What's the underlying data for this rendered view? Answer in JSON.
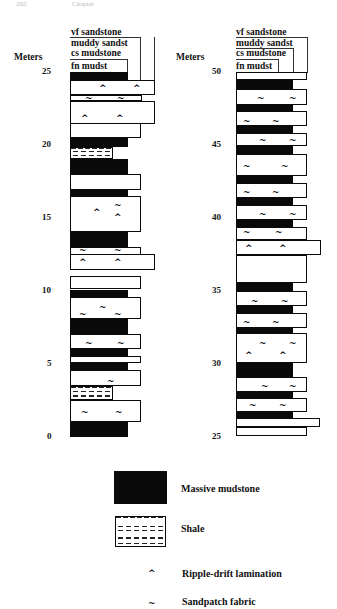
{
  "header": {
    "page_number": "202",
    "running_title": "Chapter"
  },
  "axis": {
    "units_label": "Meters"
  },
  "grain_size_labels": [
    "vf sandstone",
    "muddy sandst",
    "cs mudstone",
    "fn mudst"
  ],
  "columns": [
    {
      "id": "lower",
      "ticks": [
        {
          "label": "25",
          "y": 71
        },
        {
          "label": "20",
          "y": 144
        },
        {
          "label": "15",
          "y": 217
        },
        {
          "label": "10",
          "y": 290
        },
        {
          "label": "5",
          "y": 363
        },
        {
          "label": "0",
          "y": 436
        }
      ],
      "layers": [
        {
          "type": "mud",
          "top": 72,
          "h": 9,
          "w": 58
        },
        {
          "type": "sand",
          "top": 80,
          "h": 15,
          "w": 85,
          "syms": [
            {
              "c": "^",
              "x": 28,
              "y": 3
            },
            {
              "c": "^",
              "x": 62,
              "y": 3
            }
          ]
        },
        {
          "type": "sand",
          "top": 95,
          "h": 6,
          "w": 72,
          "syms": [
            {
              "c": "~",
              "x": 14,
              "y": -2
            },
            {
              "c": "~",
              "x": 46,
              "y": -2
            }
          ]
        },
        {
          "type": "sand",
          "top": 101,
          "h": 23,
          "w": 85,
          "syms": [
            {
              "c": "^",
              "x": 10,
              "y": 12
            },
            {
              "c": "^",
              "x": 45,
              "y": 12
            }
          ]
        },
        {
          "type": "sand",
          "top": 123,
          "h": 15,
          "w": 71
        },
        {
          "type": "mud",
          "top": 138,
          "h": 9,
          "w": 58
        },
        {
          "type": "shale",
          "top": 147,
          "h": 12,
          "w": 43
        },
        {
          "type": "mud",
          "top": 159,
          "h": 16,
          "w": 58
        },
        {
          "type": "sand",
          "top": 174,
          "h": 16,
          "w": 71
        },
        {
          "type": "mud",
          "top": 189,
          "h": 8,
          "w": 58
        },
        {
          "type": "sand",
          "top": 196,
          "h": 36,
          "w": 71,
          "syms": [
            {
              "c": "^",
              "x": 22,
              "y": 11
            },
            {
              "c": "~",
              "x": 43,
              "y": 4
            },
            {
              "c": "^",
              "x": 43,
              "y": 16
            }
          ]
        },
        {
          "type": "mud",
          "top": 232,
          "h": 16,
          "w": 58
        },
        {
          "type": "sand",
          "top": 247,
          "h": 8,
          "w": 71,
          "syms": [
            {
              "c": "~",
              "x": 8,
              "y": -2
            },
            {
              "c": "~",
              "x": 43,
              "y": -2
            }
          ]
        },
        {
          "type": "sand",
          "top": 254,
          "h": 16,
          "w": 85,
          "syms": [
            {
              "c": "^",
              "x": 8,
              "y": 3
            },
            {
              "c": "^",
              "x": 43,
              "y": 3
            }
          ]
        },
        {
          "type": "sand",
          "top": 276,
          "h": 13,
          "w": 71
        },
        {
          "type": "mud",
          "top": 290,
          "h": 7,
          "w": 58
        },
        {
          "type": "sand",
          "top": 297,
          "h": 22,
          "w": 71,
          "syms": [
            {
              "c": "~",
              "x": 28,
              "y": 5
            },
            {
              "c": "~",
              "x": 8,
              "y": 12
            },
            {
              "c": "~",
              "x": 43,
              "y": 12
            }
          ]
        },
        {
          "type": "mud",
          "top": 319,
          "h": 15,
          "w": 58
        },
        {
          "type": "sand",
          "top": 334,
          "h": 15,
          "w": 71,
          "syms": [
            {
              "c": "~",
              "x": 14,
              "y": 4
            },
            {
              "c": "~",
              "x": 46,
              "y": 4
            }
          ]
        },
        {
          "type": "mud",
          "top": 349,
          "h": 7,
          "w": 58
        },
        {
          "type": "sand",
          "top": 356,
          "h": 7,
          "w": 71
        },
        {
          "type": "mud",
          "top": 362,
          "h": 8,
          "w": 58
        },
        {
          "type": "sand",
          "top": 370,
          "h": 16,
          "w": 71,
          "syms": [
            {
              "c": "~",
              "x": 36,
              "y": 6
            }
          ]
        },
        {
          "type": "shale",
          "top": 386,
          "h": 14,
          "w": 43
        },
        {
          "type": "sand",
          "top": 400,
          "h": 22,
          "w": 71,
          "syms": [
            {
              "c": "~",
              "x": 10,
              "y": 7
            },
            {
              "c": "~",
              "x": 44,
              "y": 7
            }
          ]
        },
        {
          "type": "mud",
          "top": 422,
          "h": 15,
          "w": 58
        }
      ]
    },
    {
      "id": "upper",
      "ticks": [
        {
          "label": "50",
          "y": 71
        },
        {
          "label": "45",
          "y": 144
        },
        {
          "label": "40",
          "y": 217
        },
        {
          "label": "35",
          "y": 290
        },
        {
          "label": "30",
          "y": 363
        },
        {
          "label": "25",
          "y": 436
        }
      ],
      "layers": [
        {
          "type": "sand",
          "top": 72,
          "h": 8,
          "w": 71
        },
        {
          "type": "mud",
          "top": 80,
          "h": 9,
          "w": 57
        },
        {
          "type": "sand",
          "top": 89,
          "h": 16,
          "w": 71,
          "syms": [
            {
              "c": "~",
              "x": 20,
              "y": 4
            },
            {
              "c": "~",
              "x": 52,
              "y": 4
            }
          ]
        },
        {
          "type": "mud",
          "top": 104,
          "h": 8,
          "w": 57
        },
        {
          "type": "sand",
          "top": 111,
          "h": 15,
          "w": 71,
          "syms": [
            {
              "c": "~",
              "x": 6,
              "y": 5
            },
            {
              "c": "~",
              "x": 35,
              "y": 5
            }
          ]
        },
        {
          "type": "mud",
          "top": 126,
          "h": 7,
          "w": 57
        },
        {
          "type": "sand",
          "top": 133,
          "h": 13,
          "w": 71,
          "syms": [
            {
              "c": "~",
              "x": 22,
              "y": 2
            },
            {
              "c": "~",
              "x": 52,
              "y": 2
            }
          ]
        },
        {
          "type": "mud",
          "top": 146,
          "h": 8,
          "w": 57
        },
        {
          "type": "sand",
          "top": 154,
          "h": 22,
          "w": 71,
          "syms": [
            {
              "c": "~",
              "x": 6,
              "y": 7
            },
            {
              "c": "~",
              "x": 44,
              "y": 7
            }
          ]
        },
        {
          "type": "mud",
          "top": 176,
          "h": 7,
          "w": 57
        },
        {
          "type": "sand",
          "top": 183,
          "h": 15,
          "w": 71,
          "syms": [
            {
              "c": "~",
              "x": 6,
              "y": 4
            },
            {
              "c": "~",
              "x": 35,
              "y": 4
            }
          ]
        },
        {
          "type": "mud",
          "top": 198,
          "h": 7,
          "w": 57
        },
        {
          "type": "sand",
          "top": 205,
          "h": 15,
          "w": 71,
          "syms": [
            {
              "c": "~",
              "x": 22,
              "y": 4
            },
            {
              "c": "~",
              "x": 52,
              "y": 4
            }
          ]
        },
        {
          "type": "mud",
          "top": 220,
          "h": 7,
          "w": 57
        },
        {
          "type": "sand",
          "top": 227,
          "h": 13,
          "w": 71,
          "syms": [
            {
              "c": "~",
              "x": 6,
              "y": 0
            },
            {
              "c": "~",
              "x": 38,
              "y": 0
            }
          ]
        },
        {
          "type": "sand",
          "top": 240,
          "h": 15,
          "w": 85,
          "syms": [
            {
              "c": "^",
              "x": 8,
              "y": 3
            },
            {
              "c": "^",
              "x": 42,
              "y": 3
            }
          ]
        },
        {
          "type": "sand",
          "top": 255,
          "h": 28,
          "w": 71
        },
        {
          "type": "mud",
          "top": 283,
          "h": 8,
          "w": 57
        },
        {
          "type": "sand",
          "top": 291,
          "h": 15,
          "w": 71,
          "syms": [
            {
              "c": "~",
              "x": 14,
              "y": 5
            },
            {
              "c": "~",
              "x": 44,
              "y": 5
            }
          ]
        },
        {
          "type": "mud",
          "top": 306,
          "h": 7,
          "w": 57
        },
        {
          "type": "sand",
          "top": 313,
          "h": 15,
          "w": 71,
          "syms": [
            {
              "c": "~",
              "x": 6,
              "y": 4
            },
            {
              "c": "~",
              "x": 35,
              "y": 4
            }
          ]
        },
        {
          "type": "mud",
          "top": 327,
          "h": 7,
          "w": 57
        },
        {
          "type": "sand",
          "top": 333,
          "h": 30,
          "w": 71,
          "syms": [
            {
              "c": "~",
              "x": 22,
              "y": 5
            },
            {
              "c": "~",
              "x": 52,
              "y": 5
            },
            {
              "c": "^",
              "x": 8,
              "y": 17
            },
            {
              "c": "^",
              "x": 42,
              "y": 17
            }
          ]
        },
        {
          "type": "mud",
          "top": 363,
          "h": 15,
          "w": 57
        },
        {
          "type": "sand",
          "top": 377,
          "h": 15,
          "w": 71,
          "syms": [
            {
              "c": "~",
              "x": 24,
              "y": 4
            },
            {
              "c": "~",
              "x": 52,
              "y": 4
            }
          ]
        },
        {
          "type": "mud",
          "top": 392,
          "h": 7,
          "w": 57
        },
        {
          "type": "sand",
          "top": 398,
          "h": 14,
          "w": 71,
          "syms": [
            {
              "c": "~",
              "x": 12,
              "y": 2
            },
            {
              "c": "~",
              "x": 42,
              "y": 2
            }
          ]
        },
        {
          "type": "mud",
          "top": 412,
          "h": 7,
          "w": 57
        },
        {
          "type": "sand",
          "top": 418,
          "h": 9,
          "w": 84
        },
        {
          "type": "sand",
          "top": 427,
          "h": 9,
          "w": 71
        }
      ]
    }
  ],
  "legend": {
    "items": [
      {
        "key": "massive-mudstone",
        "label": "Massive mudstone"
      },
      {
        "key": "shale",
        "label": "Shale"
      },
      {
        "key": "ripple-drift",
        "symbol": "^",
        "label": "Ripple-drift lamination"
      },
      {
        "key": "sandpatch",
        "symbol": "~",
        "label": "Sandpatch fabric"
      }
    ]
  }
}
